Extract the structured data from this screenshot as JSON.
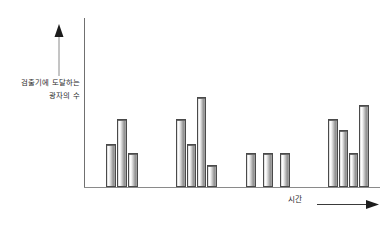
{
  "figure": {
    "title": "",
    "y_axis_label_line1": "검출기에 도달하는",
    "y_axis_label_line2": "광자의 수",
    "x_axis_label": "시간",
    "up_arrow_name": "arrow-up-icon",
    "right_arrow_name": "arrow-right-icon",
    "bar_fill_light": "#ffffff",
    "bar_fill_dark": "#8d8d8d",
    "bar_outline": "#4a4a4a",
    "axis_color": "#707070"
  },
  "chart_data": {
    "type": "bar",
    "title": "",
    "subtitle": "",
    "xlabel": "시간",
    "ylabel": "검출기에 도달하는 광자의 수",
    "grid": false,
    "legend": false,
    "axis_ticks": false,
    "xlim": [
      0,
      100
    ],
    "ylim": [
      0,
      100
    ],
    "note": "Schematic bar chart of photon counts reaching a detector over time; bars are grouped into four bursts separated by gaps.",
    "categories": [
      "b1",
      "b2",
      "b3",
      "b4",
      "b5",
      "b6",
      "b7",
      "b8",
      "b9",
      "b10",
      "b11",
      "b12",
      "b13",
      "b14"
    ],
    "values": [
      52,
      69,
      45,
      69,
      52,
      83,
      31,
      45,
      45,
      45,
      69,
      62,
      45,
      76
    ],
    "groups": [
      {
        "name": "burst-1",
        "values": [
          52,
          69,
          45
        ]
      },
      {
        "name": "burst-2",
        "values": [
          69,
          52,
          83,
          31
        ]
      },
      {
        "name": "burst-3",
        "values": [
          45,
          45,
          45
        ]
      },
      {
        "name": "burst-4",
        "values": [
          69,
          62,
          45,
          76
        ]
      }
    ],
    "bars": [
      {
        "id": "bar-1",
        "group": 1,
        "x": 106,
        "width": 10,
        "top": 144,
        "value": 52
      },
      {
        "id": "bar-2",
        "group": 1,
        "x": 117,
        "width": 10,
        "top": 119,
        "value": 69
      },
      {
        "id": "bar-3",
        "group": 1,
        "x": 128,
        "width": 10,
        "top": 153,
        "value": 45
      },
      {
        "id": "bar-4",
        "group": 2,
        "x": 176,
        "width": 10,
        "top": 119,
        "value": 69
      },
      {
        "id": "bar-5",
        "group": 2,
        "x": 187,
        "width": 9,
        "top": 144,
        "value": 52
      },
      {
        "id": "bar-6",
        "group": 2,
        "x": 197,
        "width": 9,
        "top": 97,
        "value": 83
      },
      {
        "id": "bar-7",
        "group": 2,
        "x": 207,
        "width": 10,
        "top": 165,
        "value": 31
      },
      {
        "id": "bar-8",
        "group": 3,
        "x": 246,
        "width": 10,
        "top": 153,
        "value": 45
      },
      {
        "id": "bar-9",
        "group": 3,
        "x": 263,
        "width": 10,
        "top": 153,
        "value": 45
      },
      {
        "id": "bar-10",
        "group": 3,
        "x": 280,
        "width": 10,
        "top": 153,
        "value": 45
      },
      {
        "id": "bar-11",
        "group": 4,
        "x": 328,
        "width": 10,
        "top": 119,
        "value": 69
      },
      {
        "id": "bar-12",
        "group": 4,
        "x": 339,
        "width": 9,
        "top": 130,
        "value": 62
      },
      {
        "id": "bar-13",
        "group": 4,
        "x": 349,
        "width": 9,
        "top": 153,
        "value": 45
      },
      {
        "id": "bar-14",
        "group": 4,
        "x": 359,
        "width": 10,
        "top": 105,
        "value": 76
      }
    ],
    "baseline_y": 187
  }
}
